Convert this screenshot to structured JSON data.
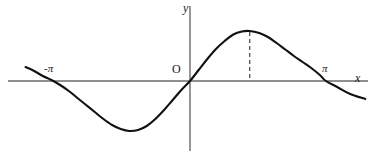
{
  "figure": {
    "title": "",
    "background_color": "#ffffff",
    "curve_color": "#111111",
    "axis_color": "#6a6a6a",
    "dashed_color": "#333333"
  },
  "labels": {
    "y_axis": "y",
    "x_axis": "x",
    "origin": "O",
    "neg_pi": "-π",
    "pi": "π"
  },
  "chart_data": {
    "type": "line",
    "title": "",
    "xlabel": "x",
    "ylabel": "y",
    "xlim": [
      -3.8,
      4.1
    ],
    "ylim": [
      -1.25,
      1.25
    ],
    "grid": false,
    "legend": null,
    "tick_labels": {
      "x": [
        "-π",
        "π"
      ],
      "y": []
    },
    "annotations": [
      {
        "name": "origin",
        "text": "O",
        "x": 0,
        "y": 0
      },
      {
        "name": "peak-dashed-dropline",
        "text": "",
        "x": 1.38,
        "y_from": 1.0,
        "y_to": 0,
        "style": "dashed"
      }
    ],
    "series": [
      {
        "name": "curve",
        "x": [
          -3.8,
          -3.6,
          -3.4,
          -3.2,
          -3.0,
          -2.8,
          -2.6,
          -2.4,
          -2.2,
          -2.0,
          -1.8,
          -1.6,
          -1.4,
          -1.2,
          -1.0,
          -0.8,
          -0.6,
          -0.4,
          -0.2,
          0.0,
          0.2,
          0.4,
          0.6,
          0.8,
          1.0,
          1.2,
          1.38,
          1.6,
          1.8,
          2.0,
          2.2,
          2.4,
          2.6,
          2.8,
          3.0,
          3.14,
          3.4,
          3.7,
          4.05
        ],
        "y": [
          0.28,
          0.2,
          0.1,
          0.02,
          -0.08,
          -0.2,
          -0.34,
          -0.48,
          -0.62,
          -0.76,
          -0.88,
          -0.96,
          -1.0,
          -0.98,
          -0.9,
          -0.76,
          -0.58,
          -0.38,
          -0.18,
          0.0,
          0.22,
          0.44,
          0.64,
          0.8,
          0.93,
          0.99,
          1.0,
          0.96,
          0.88,
          0.76,
          0.63,
          0.5,
          0.38,
          0.26,
          0.12,
          0.0,
          -0.12,
          -0.26,
          -0.36
        ]
      }
    ]
  }
}
